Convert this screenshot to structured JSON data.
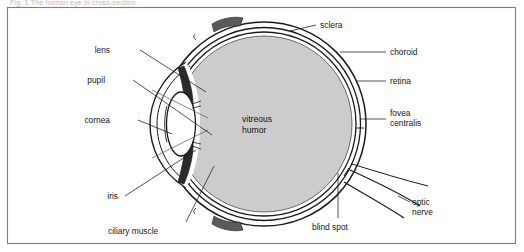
{
  "figure": {
    "caption_top": "Fig. 1   The human eye in cross-section",
    "frame_color": "#7d7d7d",
    "background_color": "#ffffff",
    "vitreous_fill": "#cccccc",
    "lens_fill": "#ffffff",
    "iris_fill": "#2b2b2b",
    "line_color": "#1a1a1a",
    "center_label_line1": "vitreous",
    "center_label_line2": "humor"
  },
  "labels": {
    "left": [
      {
        "name": "lens",
        "text": "lens"
      },
      {
        "name": "pupil",
        "text": "pupil"
      },
      {
        "name": "cornea",
        "text": "cornea"
      },
      {
        "name": "iris",
        "text": "iris"
      },
      {
        "name": "ciliary-muscle",
        "text": "ciliary muscle"
      }
    ],
    "right": [
      {
        "name": "sclera",
        "text": "sclera"
      },
      {
        "name": "choroid",
        "text": "choroid"
      },
      {
        "name": "retina",
        "text": "retina"
      },
      {
        "name": "fovea-centralis",
        "text_line1": "fovea",
        "text_line2": "centralis"
      },
      {
        "name": "optic-nerve",
        "text_line1": "optic",
        "text_line2": "nerve"
      }
    ],
    "bottom": [
      {
        "name": "blind-spot",
        "text": "blind spot"
      }
    ]
  }
}
